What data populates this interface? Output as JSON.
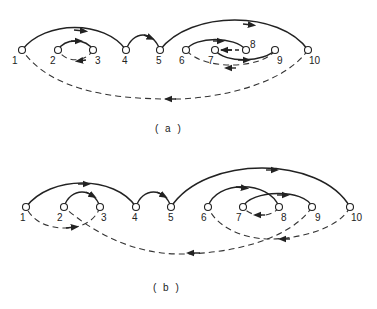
{
  "figure": {
    "panels": [
      {
        "caption": "( a )",
        "nodes": [
          "1",
          "2",
          "3",
          "4",
          "5",
          "6",
          "7",
          "8",
          "9",
          "10"
        ],
        "solid_arcs": [
          [
            "1",
            "4"
          ],
          [
            "2",
            "3"
          ],
          [
            "4",
            "5"
          ],
          [
            "5",
            "10"
          ],
          [
            "6",
            "8"
          ],
          [
            "7",
            "9"
          ]
        ],
        "dashed_arcs": [
          [
            "10",
            "1"
          ],
          [
            "3",
            "2"
          ],
          [
            "8",
            "7"
          ],
          [
            "9",
            "6"
          ]
        ]
      },
      {
        "caption": "( b )",
        "nodes": [
          "1",
          "2",
          "3",
          "4",
          "5",
          "6",
          "7",
          "8",
          "9",
          "10"
        ],
        "solid_arcs": [
          [
            "1",
            "4"
          ],
          [
            "2",
            "3"
          ],
          [
            "4",
            "5"
          ],
          [
            "5",
            "10"
          ],
          [
            "6",
            "8"
          ],
          [
            "7",
            "9"
          ]
        ],
        "dashed_arcs": [
          [
            "3",
            "1"
          ],
          [
            "9",
            "2"
          ],
          [
            "8",
            "7"
          ],
          [
            "10",
            "6"
          ]
        ]
      }
    ]
  }
}
